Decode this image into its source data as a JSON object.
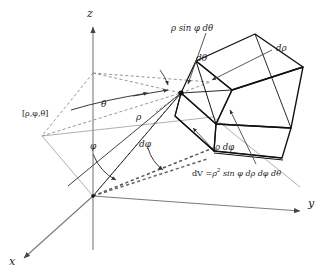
{
  "figure": {
    "background_color": "#ffffff",
    "ink_color": "#1a1a1a",
    "axis_color": "#777777",
    "dash_color": "#8a8a8a"
  },
  "axes": {
    "z_label": "z",
    "y_label": "y",
    "x_label": "x"
  },
  "angles": {
    "theta_label": "θ",
    "phi_label": "φ",
    "d_theta_label": "dθ",
    "d_phi_label": "dφ"
  },
  "radial": {
    "rho_label": "ρ",
    "point_label": "[ρ,φ,θ]"
  },
  "element_edges": {
    "arc_theta_label_pre": "ρ sin",
    "arc_theta_label": "ρ sin φ dθ",
    "d_rho_label": "dρ",
    "rho_d_phi_label": "ρ dφ"
  },
  "formula": {
    "dV_lhs": "dV =",
    "dV_rho": "ρ",
    "dV_exp": "2",
    "dV_rest": "sin φ dρ dφ dθ",
    "dV_full": "dV = ρ² sin φ dρ dφ dθ"
  }
}
